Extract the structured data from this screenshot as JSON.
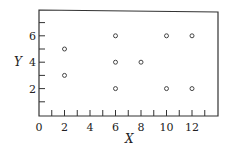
{
  "chart_data": {
    "type": "scatter",
    "title": "",
    "xlabel": "X",
    "ylabel": "Y",
    "xlim": [
      0,
      14
    ],
    "ylim": [
      0,
      8
    ],
    "xticks": [
      0,
      2,
      4,
      6,
      8,
      10,
      12
    ],
    "yticks": [
      2,
      4,
      6
    ],
    "grid": false,
    "legend": null,
    "series": [
      {
        "name": "points",
        "marker": "open-circle",
        "x": [
          2,
          2,
          6,
          6,
          6,
          8,
          10,
          10,
          12,
          12
        ],
        "y": [
          5,
          3,
          6,
          4,
          2,
          4,
          6,
          2,
          6,
          2
        ]
      }
    ]
  },
  "labels": {
    "x_axis": "X",
    "y_axis": "Y",
    "x_ticks": [
      "0",
      "2",
      "4",
      "6",
      "8",
      "10",
      "12"
    ],
    "y_ticks": [
      "2",
      "4",
      "6"
    ]
  }
}
